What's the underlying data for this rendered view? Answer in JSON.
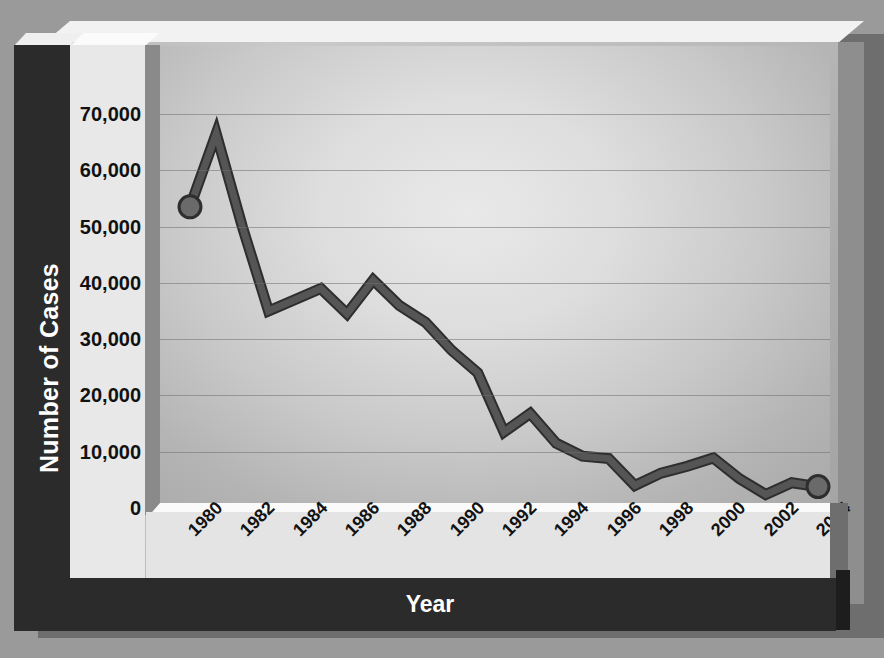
{
  "chart_data": {
    "type": "line",
    "title": "",
    "xlabel": "Year",
    "ylabel": "Number of Cases",
    "ylim": [
      0,
      75000
    ],
    "xlim": [
      1980,
      2004
    ],
    "grid": true,
    "legend": "none",
    "series": [
      {
        "name": "Number of Cases",
        "color": "#555555",
        "marker_years": [
          1980,
          2004
        ],
        "points": [
          {
            "x": 1980,
            "y": 53500
          },
          {
            "x": 1981,
            "y": 66500
          },
          {
            "x": 1982,
            "y": 50000
          },
          {
            "x": 1983,
            "y": 35000
          },
          {
            "x": 1984,
            "y": 37000
          },
          {
            "x": 1985,
            "y": 39000
          },
          {
            "x": 1986,
            "y": 34500
          },
          {
            "x": 1987,
            "y": 40500
          },
          {
            "x": 1988,
            "y": 36000
          },
          {
            "x": 1989,
            "y": 33000
          },
          {
            "x": 1990,
            "y": 28000
          },
          {
            "x": 1991,
            "y": 24000
          },
          {
            "x": 1992,
            "y": 13500
          },
          {
            "x": 1993,
            "y": 16800
          },
          {
            "x": 1994,
            "y": 11500
          },
          {
            "x": 1995,
            "y": 9200
          },
          {
            "x": 1996,
            "y": 8800
          },
          {
            "x": 1997,
            "y": 4000
          },
          {
            "x": 1998,
            "y": 6200
          },
          {
            "x": 1999,
            "y": 7400
          },
          {
            "x": 2000,
            "y": 8900
          },
          {
            "x": 2001,
            "y": 5200
          },
          {
            "x": 2002,
            "y": 2400
          },
          {
            "x": 2003,
            "y": 4500
          },
          {
            "x": 2004,
            "y": 3800
          }
        ]
      }
    ],
    "y_ticks": [
      {
        "value": 70000,
        "label": "70,000"
      },
      {
        "value": 60000,
        "label": "60,000"
      },
      {
        "value": 50000,
        "label": "50,000"
      },
      {
        "value": 40000,
        "label": "40,000"
      },
      {
        "value": 30000,
        "label": "30,000"
      },
      {
        "value": 20000,
        "label": "20,000"
      },
      {
        "value": 10000,
        "label": "10,000"
      },
      {
        "value": 0,
        "label": "0"
      }
    ],
    "x_ticks": [
      {
        "value": 1980,
        "label": "1980"
      },
      {
        "value": 1982,
        "label": "1982"
      },
      {
        "value": 1984,
        "label": "1984"
      },
      {
        "value": 1986,
        "label": "1986"
      },
      {
        "value": 1988,
        "label": "1988"
      },
      {
        "value": 1990,
        "label": "1990"
      },
      {
        "value": 1992,
        "label": "1992"
      },
      {
        "value": 1994,
        "label": "1994"
      },
      {
        "value": 1996,
        "label": "1996"
      },
      {
        "value": 1998,
        "label": "1998"
      },
      {
        "value": 2000,
        "label": "2000"
      },
      {
        "value": 2002,
        "label": "2002"
      },
      {
        "value": 2004,
        "label": "2004"
      }
    ]
  },
  "axes": {
    "y_title": "Number of Cases",
    "x_title": "Year"
  },
  "colors": {
    "line": "#555555",
    "line_outline": "#2e2e2e",
    "marker": "#6a6a6a",
    "grid": "#6f6f6f",
    "band": "#2b2b2b",
    "band_text": "#ffffff",
    "tick_text": "#111111",
    "page_background": "#9a9a9a"
  }
}
